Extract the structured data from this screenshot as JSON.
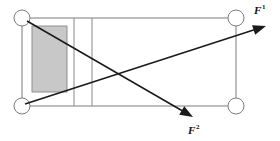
{
  "figure": {
    "type": "mechanical-schematic",
    "width": 280,
    "height": 141,
    "background_color": "#ffffff"
  },
  "frame": {
    "name": "outer-rectangle",
    "x": 22,
    "y": 18,
    "width": 214,
    "height": 88,
    "stroke_color": "#7d7d7d",
    "fill": "none"
  },
  "corner_circles": [
    {
      "id": "top-left",
      "cx": 22,
      "cy": 18,
      "r": 8,
      "stroke_color": "#7d7d7d",
      "fill_color": "#ffffff"
    },
    {
      "id": "top-right",
      "cx": 236,
      "cy": 18,
      "r": 8,
      "stroke_color": "#7d7d7d",
      "fill_color": "#ffffff"
    },
    {
      "id": "bottom-left",
      "cx": 22,
      "cy": 106,
      "r": 8,
      "stroke_color": "#7d7d7d",
      "fill_color": "#ffffff"
    },
    {
      "id": "bottom-right",
      "cx": 236,
      "cy": 106,
      "r": 8,
      "stroke_color": "#7d7d7d",
      "fill_color": "#ffffff"
    }
  ],
  "shaded_box": {
    "name": "gray-block",
    "x": 32,
    "y": 26,
    "width": 35,
    "height": 66,
    "fill_color": "#c8c8c8",
    "stroke_color": "#8f8f8f"
  },
  "dividers": [
    {
      "id": "divider-left",
      "x": 74,
      "y1": 18,
      "y2": 106,
      "stroke_color": "#8a8a8a"
    },
    {
      "id": "divider-right",
      "x": 92,
      "y1": 18,
      "y2": 106,
      "stroke_color": "#8a8a8a"
    }
  ],
  "forces": [
    {
      "id": "F1",
      "label": "F",
      "superscript": "1",
      "origin_x": 25,
      "origin_y": 104,
      "tip_x": 266,
      "tip_y": 26,
      "label_x": 254,
      "label_y": 14,
      "color": "#1a1a1a",
      "description": "Force vector from bottom-left joint pointing up and to the right"
    },
    {
      "id": "F2",
      "label": "F",
      "superscript": "2",
      "origin_x": 27,
      "origin_y": 21,
      "tip_x": 193,
      "tip_y": 117,
      "label_x": 188,
      "label_y": 134,
      "color": "#1a1a1a",
      "description": "Force vector from top-left joint pointing down and to the right"
    }
  ],
  "crossing_point": {
    "x": 118,
    "y": 72
  }
}
